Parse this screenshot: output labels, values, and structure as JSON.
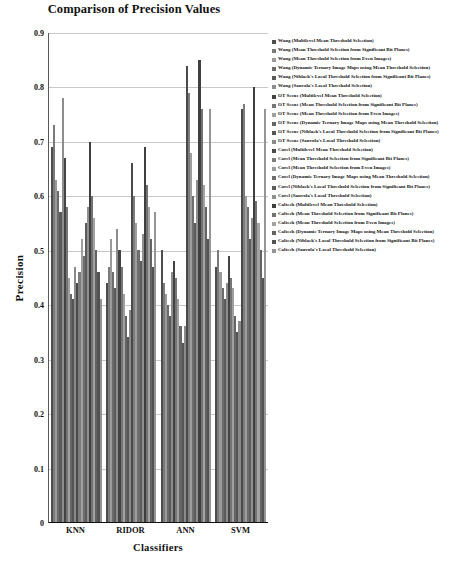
{
  "chart_data": {
    "type": "bar",
    "title": "Comparison of Precision Values",
    "xlabel": "Classifiers",
    "ylabel": "Precision",
    "ylim": [
      0,
      0.9
    ],
    "ytick_labels": [
      "0.9",
      "0.8",
      "0.7",
      "0.6",
      "0.5",
      "0.4",
      "0.3",
      "0.2",
      "0.1",
      "0"
    ],
    "ytick_values": [
      0.9,
      0.8,
      0.7,
      0.6,
      0.5,
      0.4,
      0.3,
      0.2,
      0.1,
      0
    ],
    "grid": true,
    "legend_position": "right",
    "categories": [
      "KNN",
      "RIDOR",
      "ANN",
      "SVM"
    ],
    "series": [
      {
        "name": "Wang (Multilevel Mean Threshold Selection)",
        "color": "#4d4d4d",
        "values": [
          0.69,
          0.44,
          0.5,
          0.47
        ]
      },
      {
        "name": "Wang (Mean Threshold Selection from Significant Bit Planes)",
        "color": "#7a7a7a",
        "values": [
          0.73,
          0.47,
          0.44,
          0.5
        ]
      },
      {
        "name": "Wang (Mean Threshold Selection from Even Images)",
        "color": "#9a9a9a",
        "values": [
          0.63,
          0.52,
          0.42,
          0.46
        ]
      },
      {
        "name": "Wang (Dynamic Ternary Image Maps using Mean Threshold Selection)",
        "color": "#6b6b6b",
        "values": [
          0.61,
          0.46,
          0.4,
          0.43
        ]
      },
      {
        "name": "Wang (Niblack's Local Threshold Selection from Significant Bit Planes)",
        "color": "#5a5a5a",
        "values": [
          0.57,
          0.43,
          0.38,
          0.41
        ]
      },
      {
        "name": "Wang (Sauvola's Local Threshold Selection)",
        "color": "#8d8d8d",
        "values": [
          0.78,
          0.54,
          0.46,
          0.44
        ]
      },
      {
        "name": "OT Scene (Multilevel Mean Threshold Selection)",
        "color": "#434343",
        "values": [
          0.67,
          0.5,
          0.48,
          0.49
        ]
      },
      {
        "name": "OT Scene (Mean Threshold Selection from Significant Bit Planes)",
        "color": "#757575",
        "values": [
          0.58,
          0.47,
          0.45,
          0.45
        ]
      },
      {
        "name": "OT Scene (Mean Threshold Selection from Even Images)",
        "color": "#a0a0a0",
        "values": [
          0.45,
          0.42,
          0.41,
          0.43
        ]
      },
      {
        "name": "OT Scene (Dynamic Ternary Image Maps using Mean Threshold Selection)",
        "color": "#666666",
        "values": [
          0.42,
          0.38,
          0.36,
          0.38
        ]
      },
      {
        "name": "OT Scene (Niblack's Local Threshold Selection from Significant Bit Planes)",
        "color": "#555555",
        "values": [
          0.41,
          0.34,
          0.33,
          0.35
        ]
      },
      {
        "name": "OT Scene (Sauvola's Local Threshold Selection)",
        "color": "#8a8a8a",
        "values": [
          0.47,
          0.39,
          0.36,
          0.37
        ]
      },
      {
        "name": "Corel (Multilevel Mean Threshold Selection)",
        "color": "#4a4a4a",
        "values": [
          0.44,
          0.66,
          0.84,
          0.76
        ]
      },
      {
        "name": "Corel (Mean Threshold Selection from Significant Bit Planes)",
        "color": "#7d7d7d",
        "values": [
          0.46,
          0.6,
          0.79,
          0.77
        ]
      },
      {
        "name": "Corel (Mean Threshold Selection from Even Images)",
        "color": "#9e9e9e",
        "values": [
          0.52,
          0.55,
          0.68,
          0.6
        ]
      },
      {
        "name": "Corel (Dynamic Ternary Image Maps using Mean Threshold Selection)",
        "color": "#6e6e6e",
        "values": [
          0.49,
          0.5,
          0.6,
          0.58
        ]
      },
      {
        "name": "Corel (Niblack's Local Threshold Selection from Significant Bit Planes)",
        "color": "#5c5c5c",
        "values": [
          0.55,
          0.48,
          0.55,
          0.52
        ]
      },
      {
        "name": "Corel (Sauvola's Local Threshold Selection)",
        "color": "#909090",
        "values": [
          0.58,
          0.53,
          0.63,
          0.56
        ]
      },
      {
        "name": "Caltech (Multilevel Mean Threshold Selection)",
        "color": "#3f3f3f",
        "values": [
          0.7,
          0.69,
          0.85,
          0.8
        ]
      },
      {
        "name": "Caltech (Mean Threshold Selection from Significant Bit Planes)",
        "color": "#727272",
        "values": [
          0.6,
          0.62,
          0.76,
          0.59
        ]
      },
      {
        "name": "Caltech (Mean Threshold Selection from Even Images)",
        "color": "#a3a3a3",
        "values": [
          0.56,
          0.58,
          0.62,
          0.55
        ]
      },
      {
        "name": "Caltech (Dynamic Ternary Image Maps using Mean Threshold Selection)",
        "color": "#636363",
        "values": [
          0.5,
          0.52,
          0.58,
          0.5
        ]
      },
      {
        "name": "Caltech (Niblack's Local Threshold Selection from Significant Bit Planes)",
        "color": "#525252",
        "values": [
          0.46,
          0.47,
          0.52,
          0.45
        ]
      },
      {
        "name": "Caltech (Sauvola's Local Threshold Selection)",
        "color": "#959595",
        "values": [
          0.41,
          0.57,
          0.76,
          0.76
        ]
      }
    ]
  }
}
